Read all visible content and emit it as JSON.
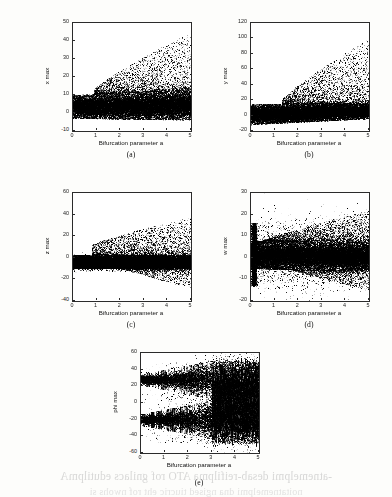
{
  "figure": {
    "kind": "bifurcation-diagram-grid",
    "panel_count": 5,
    "shared_xlabel": "Bifurcation parameter a"
  },
  "captions": {
    "a": "(a)",
    "b": "(b)",
    "c": "(c)",
    "d": "(d)",
    "e": "(e)"
  },
  "page_showthrough": {
    "line1": "-atnemelpmi desab-reifilpma ATO rof gnilacs edutilpmA",
    "line2": "noitatnemelpmi dna ngised tiucric eht rof nwohs si"
  },
  "chart_data": [
    {
      "id": "a",
      "type": "scatter",
      "title": "",
      "xlabel": "Bifurcation parameter a",
      "ylabel": "x max",
      "xlim": [
        0,
        5
      ],
      "ylim": [
        -10,
        50
      ],
      "xticks": [
        0,
        1,
        2,
        3,
        4,
        5
      ],
      "yticks": [
        -10,
        0,
        10,
        20,
        30,
        40,
        50
      ],
      "grid": false,
      "legend": null,
      "marker": ".",
      "color": "#000000",
      "description": "Dense black attractor band spanning roughly -3 to 10 across the full range of a, with a sparse upward-fanning cloud of outliers that begins near a=1 and widens with a, reaching about 45 near a=4.",
      "band": {
        "low": -3,
        "high": 10,
        "low_at_5": -4,
        "high_at_5": 13
      },
      "outliers": {
        "onset_a": 0.9,
        "max_at_a1": 13,
        "max_at_a5": 45
      }
    },
    {
      "id": "b",
      "type": "scatter",
      "title": "",
      "xlabel": "Bifurcation parameter a",
      "ylabel": "y max",
      "xlim": [
        0,
        5
      ],
      "ylim": [
        -20,
        120
      ],
      "xticks": [
        0,
        1,
        2,
        3,
        4,
        5
      ],
      "yticks": [
        -20,
        0,
        20,
        40,
        60,
        80,
        100,
        120
      ],
      "grid": false,
      "legend": null,
      "marker": ".",
      "color": "#000000",
      "description": "Thick black band centred near 5 spanning about -12 to 15, with sparse scattered outliers rising from a=1.3 onward and peaking near 90 to 100 around a=3.8 and a=4.6.",
      "band": {
        "low": -12,
        "high": 15,
        "low_at_5": -4,
        "high_at_5": 16
      },
      "outliers": {
        "onset_a": 1.3,
        "max_at_a1": 20,
        "max_at_a5": 100
      }
    },
    {
      "id": "c",
      "type": "scatter",
      "title": "",
      "xlabel": "Bifurcation parameter a",
      "ylabel": "z max",
      "xlim": [
        0,
        5
      ],
      "ylim": [
        -40,
        60
      ],
      "xticks": [
        0,
        1,
        2,
        3,
        4,
        5
      ],
      "yticks": [
        -40,
        -20,
        0,
        20,
        40,
        60
      ],
      "grid": false,
      "legend": null,
      "marker": ".",
      "color": "#000000",
      "description": "Very dense band straddling zero from about -10 to 3, symmetric spray of points above and below that widens with a; upper outliers reach about 38 and lower outliers about -28 near a=4.",
      "band": {
        "low": -10,
        "high": 3,
        "low_at_5": -9,
        "high_at_5": 2
      },
      "outliers": {
        "onset_a": 0.8,
        "max_at_a1": 12,
        "max_at_a5": 38,
        "min_at_a5": -28
      }
    },
    {
      "id": "d",
      "type": "scatter",
      "title": "",
      "xlabel": "Bifurcation parameter a",
      "ylabel": "w max",
      "xlim": [
        0,
        5
      ],
      "ylim": [
        -20,
        30
      ],
      "xticks": [
        0,
        1,
        2,
        3,
        4,
        5
      ],
      "yticks": [
        -20,
        -10,
        0,
        10,
        20,
        30
      ],
      "grid": false,
      "legend": null,
      "marker": ".",
      "color": "#000000",
      "description": "Broad dense band roughly -5 to 8 of nearly constant width across a, with a tall narrow spike of points at the extreme left edge near a=0.1 reaching from -12 up to 16, and a diffuse halo of outliers between -15 and 22.",
      "band": {
        "low": -5,
        "high": 8,
        "low_at_5": -6,
        "high_at_5": 7
      },
      "left_spike": {
        "a": 0.12,
        "low": -13,
        "high": 16
      },
      "outliers": {
        "onset_a": 0.2,
        "max_at_a5": 22,
        "min_at_a5": -15
      }
    },
    {
      "id": "e",
      "type": "scatter",
      "title": "",
      "xlabel": "Bifurcation parameter a",
      "ylabel": "phi max",
      "xlim": [
        0,
        5
      ],
      "ylim": [
        -60,
        60
      ],
      "xticks": [
        0,
        1,
        2,
        3,
        4,
        5
      ],
      "yticks": [
        -60,
        -40,
        -20,
        0,
        20,
        40,
        60
      ],
      "grid": false,
      "legend": null,
      "marker": ".",
      "color": "#000000",
      "description": "Bimodal structure: an upper band near +28 and a lower band near -20 for a below 3, both thickening into dense vertical streaks; beyond a=3 the two bands merge into continuous full-height vertical striping spanning about -45 to 48.",
      "upper_band": {
        "center": 28,
        "spread": 12
      },
      "lower_band": {
        "center": -20,
        "spread": 12
      },
      "merge_a": 3.0,
      "streak_range": [
        -48,
        50
      ]
    }
  ]
}
